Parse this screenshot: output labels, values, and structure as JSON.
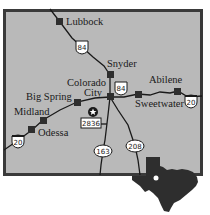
{
  "map": {
    "colors": {
      "background": "#b9b9b9",
      "frame": "#3a3a3a",
      "road": "#1a1a1a",
      "city_marker": "#2e2e2e",
      "texas_silhouette": "#2e2e2e",
      "text": "#1a1a1a"
    },
    "cities": [
      {
        "name": "Lubbock"
      },
      {
        "name": "Snyder"
      },
      {
        "name": "Colorado",
        "name2": "City"
      },
      {
        "name": "Abilene"
      },
      {
        "name": "Sweetwater"
      },
      {
        "name": "Big Spring"
      },
      {
        "name": "Midland"
      },
      {
        "name": "Odessa"
      }
    ],
    "shields": [
      {
        "type": "us-highway",
        "number": "84"
      },
      {
        "type": "us-highway",
        "number": "84"
      },
      {
        "type": "interstate",
        "number": "20"
      },
      {
        "type": "interstate",
        "number": "20"
      },
      {
        "type": "farm-road",
        "number": "2836"
      },
      {
        "type": "state-highway",
        "number": "163"
      },
      {
        "type": "state-highway",
        "number": "208"
      }
    ],
    "marker": {
      "icon": "star-icon"
    },
    "inset": {
      "icon": "texas-silhouette-icon"
    }
  }
}
